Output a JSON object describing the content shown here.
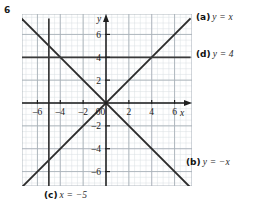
{
  "question": {
    "number": "6"
  },
  "chart_data": {
    "type": "line",
    "title": "",
    "xlabel": "x",
    "ylabel": "y",
    "xlim": [
      -7.4,
      7.4
    ],
    "ylim": [
      -7.4,
      7.4
    ],
    "grid": true,
    "minor_grid": true,
    "grid_step_major": 2,
    "grid_step_minor": 0.5,
    "x_ticks": [
      -6,
      -4,
      -2,
      0,
      2,
      4,
      6
    ],
    "x_tick_labels": [
      "–6",
      "–4",
      "–2",
      "0",
      "2",
      "4",
      "6"
    ],
    "y_ticks": [
      -6,
      -4,
      -2,
      2,
      4,
      6
    ],
    "y_tick_labels": [
      "–6",
      "–4",
      "–2",
      "2",
      "4",
      "6"
    ],
    "axis_arrows": [
      "x-positive",
      "y-positive"
    ],
    "series": [
      {
        "name": "a",
        "label": "y = x",
        "equation": "y = x",
        "kind": "line",
        "slope": 1,
        "intercept": 0,
        "endpoints": [
          [
            -7.4,
            -7.4
          ],
          [
            7.4,
            7.4
          ]
        ],
        "color": "#2b2b2b"
      },
      {
        "name": "b",
        "label": "y = −x",
        "equation": "y = −x",
        "kind": "line",
        "slope": -1,
        "intercept": 0,
        "endpoints": [
          [
            -7.4,
            7.4
          ],
          [
            7.4,
            -7.4
          ]
        ],
        "color": "#2b2b2b"
      },
      {
        "name": "c",
        "label": "x = −5",
        "equation": "x = −5",
        "kind": "vertical",
        "x_value": -5,
        "endpoints": [
          [
            -5,
            -7.4
          ],
          [
            -5,
            7.4
          ]
        ],
        "color": "#3a3a3a"
      },
      {
        "name": "d",
        "label": "y = 4",
        "equation": "y = 4",
        "kind": "horizontal",
        "y_value": 4,
        "endpoints": [
          [
            -7.4,
            4
          ],
          [
            7.4,
            4
          ]
        ],
        "color": "#3a3a3a"
      }
    ]
  },
  "callouts": {
    "a": {
      "tag": "(a)",
      "equation": "y = x"
    },
    "b": {
      "tag": "(b)",
      "equation": "y = −x"
    },
    "c": {
      "tag": "(c)",
      "equation": "x = −5"
    },
    "d": {
      "tag": "(d)",
      "equation": "y = 4"
    }
  },
  "colors": {
    "minor_grid": "#d8dde2",
    "major_grid": "#aab2ba",
    "axis": "#1f1f1f",
    "curve": "#2b2b2b",
    "text": "#1a1a1a",
    "background": "#ffffff"
  }
}
